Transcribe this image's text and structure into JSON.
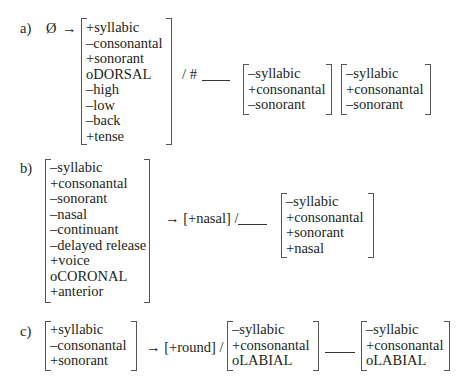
{
  "rules": {
    "a": {
      "label": "a)",
      "input": "Ø",
      "arrow": "→",
      "target": [
        "+syllabic",
        "–consonantal",
        "+sonorant",
        "oDORSAL",
        "–high",
        "–low",
        "–back",
        "+tense"
      ],
      "environment_prefix": "/ #",
      "env_right_1": [
        "–syllabic",
        "+consonantal",
        "–sonorant"
      ],
      "env_right_2": [
        "–syllabic",
        "+consonantal",
        "–sonorant"
      ]
    },
    "b": {
      "label": "b)",
      "input": [
        "–syllabic",
        "+consonantal",
        "–sonorant",
        "–nasal",
        "–continuant",
        "–delayed release",
        "+voice",
        "oCORONAL",
        "+anterior"
      ],
      "change": "→ [+nasal] /",
      "env_right": [
        "–syllabic",
        "+consonantal",
        "+sonorant",
        "+nasal"
      ]
    },
    "c": {
      "label": "c)",
      "input": [
        "+syllabic",
        "–consonantal",
        "+sonorant"
      ],
      "change": "→ [+round] /",
      "env_left": [
        "–syllabic",
        "+consonantal",
        "oLABIAL"
      ],
      "env_right": [
        "–syllabic",
        "+consonantal",
        "oLABIAL"
      ]
    }
  }
}
